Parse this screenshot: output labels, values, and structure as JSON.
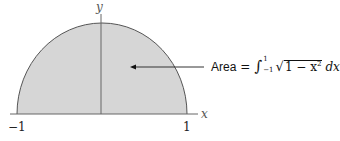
{
  "figure": {
    "axis_labels": {
      "x": "x",
      "y": "y"
    },
    "tick_labels": {
      "left": "−1",
      "right": "1"
    },
    "annotation": {
      "word": "Area",
      "equals": "=",
      "integral_sign": "∫",
      "upper_limit": "1",
      "lower_limit": "−1",
      "sqrt_sign": "√",
      "radicand": "1 − x",
      "exponent": "2",
      "differential": "dx"
    },
    "colors": {
      "fill": "#d6d6d6",
      "curve": "#555555",
      "axis": "#666666",
      "arrow": "#333333"
    }
  }
}
